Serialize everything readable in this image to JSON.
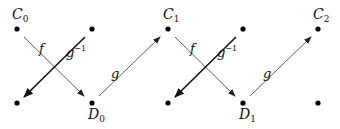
{
  "diagram": {
    "nodes": [
      {
        "id": "C0",
        "label": "C",
        "sub": "0",
        "x": 17,
        "y": 29,
        "label_pos": "above"
      },
      {
        "id": "T1",
        "label": "",
        "x": 92,
        "y": 29
      },
      {
        "id": "C1",
        "label": "C",
        "sub": "1",
        "x": 168,
        "y": 29,
        "label_pos": "above"
      },
      {
        "id": "T3",
        "label": "",
        "x": 243,
        "y": 29
      },
      {
        "id": "C2",
        "label": "C",
        "sub": "2",
        "x": 318,
        "y": 29,
        "label_pos": "above"
      },
      {
        "id": "B0",
        "label": "",
        "x": 17,
        "y": 103
      },
      {
        "id": "D0",
        "label": "D",
        "sub": "0",
        "x": 92,
        "y": 103,
        "label_pos": "below"
      },
      {
        "id": "B2",
        "label": "",
        "x": 168,
        "y": 103
      },
      {
        "id": "D1",
        "label": "D",
        "sub": "1",
        "x": 243,
        "y": 103,
        "label_pos": "below"
      },
      {
        "id": "B4",
        "label": "",
        "x": 318,
        "y": 103
      }
    ],
    "edges": [
      {
        "from": "C0",
        "to": "D0",
        "label": "f",
        "weight": "thin"
      },
      {
        "from": "T1",
        "to": "B0",
        "label": "g^-1",
        "weight": "thick"
      },
      {
        "from": "D0",
        "to": "C1",
        "label": "g",
        "weight": "thin"
      },
      {
        "from": "C1",
        "to": "D1",
        "label": "f",
        "weight": "thin"
      },
      {
        "from": "T3",
        "to": "B2",
        "label": "g^-1",
        "weight": "thick"
      },
      {
        "from": "D1",
        "to": "C2",
        "label": "g",
        "weight": "thin"
      }
    ],
    "labels": {
      "c0": "C",
      "c0_sub": "0",
      "c1": "C",
      "c1_sub": "1",
      "c2": "C",
      "c2_sub": "2",
      "d0": "D",
      "d0_sub": "0",
      "d1": "D",
      "d1_sub": "1",
      "f": "f",
      "g": "g",
      "ginv": "g",
      "ginv_sup": "−1"
    }
  }
}
